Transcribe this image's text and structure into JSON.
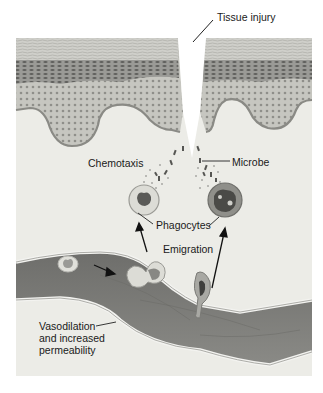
{
  "diagram": {
    "colors": {
      "background": "#ffffff",
      "tissue_panel": "#ebebe6",
      "epidermis_top": "#c9c9c4",
      "epidermis_dark": "#8e8e8a",
      "epidermis_cells": "#b8b8b2",
      "vessel_lumen": "#7d7d7a",
      "vessel_wall": "#e2e2de",
      "phagocyte_cytoplasm": "#d8d8d2",
      "phagocyte_nucleus": "#555552",
      "label_text": "#1a1a1a"
    },
    "labels": {
      "tissue_injury": "Tissue injury",
      "chemotaxis": "Chemotaxis",
      "microbe": "Microbe",
      "phagocytes": "Phagocytes",
      "emigration": "Emigration",
      "vasodilation_line1": "Vasodilation",
      "vasodilation_line2": "and increased",
      "vasodilation_line3": "permeability"
    },
    "structures": [
      "epidermis-left",
      "epidermis-right",
      "wound-gap",
      "dermis",
      "microbes",
      "phagocyte-left",
      "phagocyte-right",
      "blood-vessel",
      "white-cell-in-lumen",
      "cell-squeezing-through-wall",
      "cell-emigrating"
    ]
  }
}
